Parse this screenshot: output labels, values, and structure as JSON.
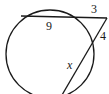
{
  "diagram": {
    "type": "circle-two-secants",
    "labels": {
      "chord_segment": "9",
      "external_segment_top": "3",
      "external_segment_side": "4",
      "unknown_segment": "x"
    },
    "colors": {
      "stroke": "#1a1a1a",
      "background": "#ffffff"
    }
  }
}
